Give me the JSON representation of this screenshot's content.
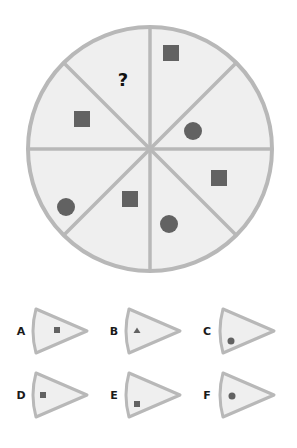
{
  "puzzle": {
    "type": "missing-segment",
    "colors": {
      "background": "#ffffff",
      "segment_fill": "#efefef",
      "stroke": "#b8b8b8",
      "shape_fill": "#626262",
      "text": "#111111"
    },
    "wheel": {
      "center": [
        150,
        149
      ],
      "radius": 122,
      "segments": 8,
      "missing_marker": "?",
      "shapes": [
        {
          "segment": "top-right-outer",
          "shape": "square",
          "x": 171,
          "y": 53
        },
        {
          "segment": "right-upper",
          "shape": "circle",
          "x": 193,
          "y": 131
        },
        {
          "segment": "right-lower",
          "shape": "square",
          "x": 219,
          "y": 178
        },
        {
          "segment": "bottom-right",
          "shape": "circle",
          "x": 169,
          "y": 224
        },
        {
          "segment": "bottom-left",
          "shape": "square",
          "x": 130,
          "y": 199
        },
        {
          "segment": "left-lower",
          "shape": "circle",
          "x": 66,
          "y": 207
        },
        {
          "segment": "left-upper",
          "shape": "square",
          "x": 82,
          "y": 119
        },
        {
          "segment": "top-left",
          "shape": "question-mark",
          "x": 123,
          "y": 79
        }
      ]
    },
    "options": [
      {
        "label": "A",
        "shape": "square",
        "position": "middle"
      },
      {
        "label": "B",
        "shape": "triangle",
        "position": "near-arc"
      },
      {
        "label": "C",
        "shape": "circle",
        "position": "lower-near-arc"
      },
      {
        "label": "D",
        "shape": "square",
        "position": "near-arc"
      },
      {
        "label": "E",
        "shape": "square",
        "position": "lower-near-arc"
      },
      {
        "label": "F",
        "shape": "circle",
        "position": "near-arc"
      }
    ]
  }
}
